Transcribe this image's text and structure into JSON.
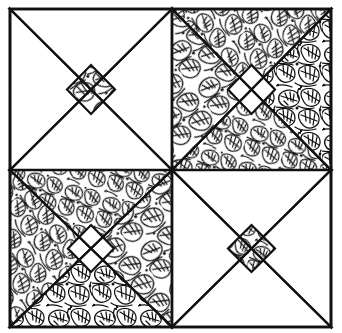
{
  "image": {
    "title": "Four-Patch Quilt Block Pattern",
    "description": "Black and white line drawing of a pieced quilt composed of four square blocks in a two-by-two arrangement, alternating two colorways of a star and hourglass block sewn from a dense leaf-print fabric and a plain white fabric.",
    "width": 342,
    "height": 333,
    "background_color": "#ffffff",
    "ink_color": "#111111",
    "medium": "pen-and-ink line drawing"
  },
  "layout": {
    "margin_left": 10,
    "margin_top": 9,
    "pattern_width": 321,
    "pattern_height": 318,
    "rows": 2,
    "columns": 2,
    "seam_x": 172,
    "seam_y": 170,
    "seam_line_width": 2.4,
    "outer_frame_line_width": 2.8
  },
  "fabrics": [
    {
      "id": "leaf-print",
      "name": "Leaf print",
      "ground_color": "#ffffff",
      "line_color": "#111111",
      "motif": "overlapping veined leaves",
      "coverage": "dense allover"
    },
    {
      "id": "plain-white",
      "name": "Plain white",
      "ground_color": "#ffffff",
      "line_color": "#111111",
      "motif": "none",
      "coverage": "solid"
    }
  ],
  "blocks": [
    {
      "position": "top-left",
      "name": "Block 1",
      "colorway": "dark",
      "background_fabric": "leaf-print",
      "star_fabric": "plain-white",
      "center_fabric": "leaf-print",
      "center_shape": "diamond",
      "point_count": 4,
      "x": 10,
      "y": 9,
      "size": 162
    },
    {
      "position": "top-right",
      "name": "Block 2",
      "colorway": "light",
      "background_fabric": "plain-white",
      "star_fabric": "leaf-print",
      "center_fabric": "plain-white",
      "center_shape": "diamond",
      "point_count": 4,
      "x": 172,
      "y": 9,
      "size": 159
    },
    {
      "position": "bottom-left",
      "name": "Block 3",
      "colorway": "light",
      "background_fabric": "plain-white",
      "star_fabric": "leaf-print",
      "center_fabric": "plain-white",
      "center_shape": "diamond",
      "point_count": 4,
      "x": 10,
      "y": 170,
      "size": 162
    },
    {
      "position": "bottom-right",
      "name": "Block 4",
      "colorway": "dark",
      "background_fabric": "leaf-print",
      "star_fabric": "plain-white",
      "center_fabric": "leaf-print",
      "center_shape": "diamond",
      "point_count": 4,
      "x": 172,
      "y": 170,
      "size": 159
    }
  ],
  "geometry": {
    "star_point_fraction": 0.5,
    "center_diamond_fraction": 0.3,
    "notes": "Each block is a square divided by lines from the four corners to the midpoints of the opposite-facing sides, producing four triangles meeting at a central diamond."
  }
}
